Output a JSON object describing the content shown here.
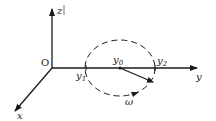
{
  "diagram": {
    "type": "3d-coordinate-system-with-circular-motion",
    "colors": {
      "stroke": "#1a1a1a",
      "background": "#ffffff"
    },
    "origin": {
      "label": "O",
      "x": 52,
      "y": 68
    },
    "axes": [
      {
        "name": "z",
        "label": "z",
        "from": [
          52,
          68
        ],
        "to": [
          52,
          7
        ]
      },
      {
        "name": "y",
        "label": "y",
        "from": [
          52,
          68
        ],
        "to": [
          199,
          68
        ]
      },
      {
        "name": "x",
        "label": "x",
        "from": [
          52,
          68
        ],
        "to": [
          14,
          112
        ]
      }
    ],
    "circle": {
      "style": "dashed",
      "cx": 120,
      "cy": 68,
      "rx": 36,
      "ry": 28
    },
    "points": [
      {
        "label": "y",
        "subscript": "0",
        "x": 120,
        "y": 68
      },
      {
        "label": "y",
        "subscript": "1",
        "x": 86,
        "y": 68
      },
      {
        "label": "y",
        "subscript": "2",
        "x": 155,
        "y": 68
      }
    ],
    "vector": {
      "from": [
        120,
        68
      ],
      "to": [
        154,
        82
      ]
    },
    "rotation": {
      "label": "ω",
      "direction": "counterclockwise-front"
    }
  }
}
